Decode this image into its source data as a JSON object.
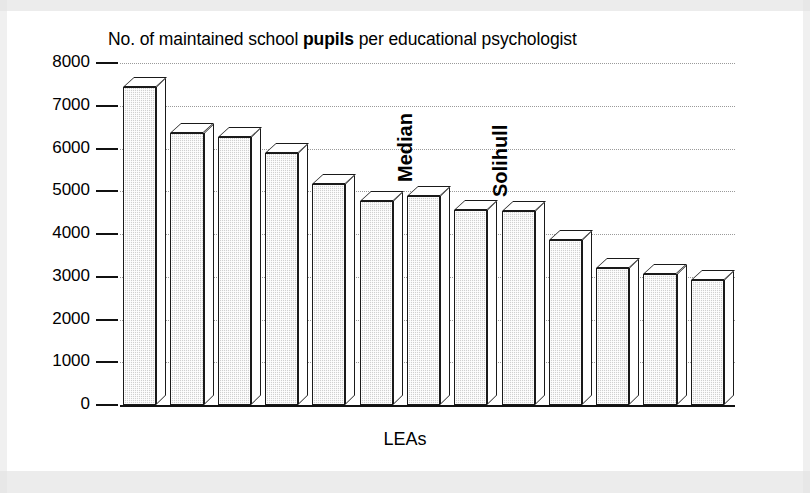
{
  "chart_data": {
    "type": "bar",
    "title": "No. of maintained school pupils per educational psychologist",
    "title_emphasis": "pupils",
    "xlabel": "LEAs",
    "ylabel": "",
    "ylim": [
      0,
      8000
    ],
    "ytick_labels": [
      "8000",
      "7000",
      "6000",
      "5000",
      "4000",
      "3000",
      "2000",
      "1000",
      "0"
    ],
    "ytick_values": [
      8000,
      7000,
      6000,
      5000,
      4000,
      3000,
      2000,
      1000,
      0
    ],
    "grid": "horizontal-dotted",
    "legend": "none",
    "categories": [
      "LEA 1",
      "LEA 2",
      "LEA 3",
      "LEA 4",
      "LEA 5",
      "LEA 6",
      "LEA 7",
      "LEA 8",
      "LEA 9",
      "LEA 10",
      "LEA 11",
      "LEA 12",
      "LEA 13"
    ],
    "values": [
      7440,
      6370,
      6280,
      5900,
      5170,
      4780,
      4880,
      4560,
      4530,
      3870,
      3200,
      3070,
      2930
    ],
    "annotations": [
      {
        "text": "Median",
        "bar_index": 6,
        "orientation": "vertical"
      },
      {
        "text": "Solihull",
        "bar_index": 8,
        "orientation": "vertical"
      }
    ],
    "bar_style": {
      "three_d": true,
      "fill_color": "#d0d0d0",
      "edge_color": "#1a1a1a",
      "top_face_color": "#ffffff",
      "side_face_color": "#ffffff"
    }
  }
}
